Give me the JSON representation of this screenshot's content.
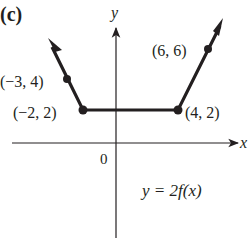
{
  "panel_label": "(c)",
  "axes": {
    "x_label": "x",
    "y_label": "y",
    "origin_label": "0"
  },
  "equation": "y = 2f(x)",
  "points": [
    {
      "label": "(−3, 4)",
      "x": -3,
      "y": 4
    },
    {
      "label": "(−2, 2)",
      "x": -2,
      "y": 2
    },
    {
      "label": "(4, 2)",
      "x": 4,
      "y": 2
    },
    {
      "label": "(6, 6)",
      "x": 6,
      "y": 6
    }
  ],
  "colors": {
    "ink": "#231f20",
    "background": "#ffffff"
  }
}
